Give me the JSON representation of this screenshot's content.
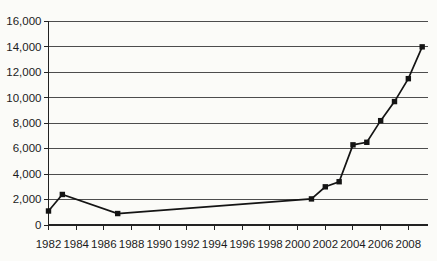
{
  "chart_data": {
    "type": "line",
    "title": "",
    "xlabel": "",
    "ylabel": "",
    "legend": "none",
    "grid": "horizontal",
    "marker": "square",
    "x": [
      1982,
      1983,
      1987,
      2001,
      2002,
      2003,
      2004,
      2005,
      2006,
      2007,
      2008,
      2009
    ],
    "values": [
      1100,
      2400,
      900,
      2050,
      3000,
      3400,
      6300,
      6500,
      8200,
      9700,
      11500,
      14000
    ],
    "xlim": [
      1982,
      2009.5
    ],
    "ylim": [
      0,
      16000
    ],
    "y_tick_step": 2000,
    "x_tick_years": [
      1982,
      1984,
      1986,
      1988,
      1990,
      1992,
      1994,
      1996,
      1998,
      2000,
      2002,
      2004,
      2006,
      2008
    ],
    "x_tick_labels": [
      "1982",
      "1984",
      "1986",
      "1988",
      "1990",
      "1992",
      "1994",
      "1996",
      "1998",
      "2000",
      "2002",
      "2004",
      "2006",
      "2008"
    ],
    "y_tick_labels": [
      "0",
      "2,000",
      "4,000",
      "6,000",
      "8,000",
      "10,000",
      "12,000",
      "14,000",
      "16,000"
    ],
    "colors": {
      "line": "#141414",
      "marker": "#141414",
      "grid": "#4d4d4d",
      "axis": "#222222",
      "tick_text": "#1c1c1c",
      "background": "#fbfbf8"
    }
  }
}
